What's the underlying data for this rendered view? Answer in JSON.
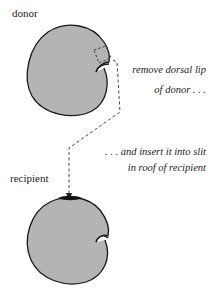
{
  "labels": {
    "donor": "donor",
    "recipient": "recipient"
  },
  "captions": {
    "step1_line1": "remove dorsal lip",
    "step1_line2": "of donor . . .",
    "step2_line1": ". . . and insert it into slit",
    "step2_line2": "in roof of recipient"
  },
  "colors": {
    "embryo_fill": "#b4b4b4",
    "outline": "#1a1a1a",
    "graft": "#111111"
  }
}
